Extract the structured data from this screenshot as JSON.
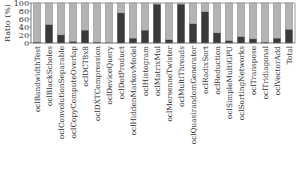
{
  "chart_data": {
    "type": "bar",
    "stacked": true,
    "title": "",
    "xlabel": "",
    "ylabel": "Ratio (%)",
    "ylim": [
      0,
      100
    ],
    "yticks": [
      0,
      20,
      40,
      60,
      80,
      100
    ],
    "grid": false,
    "legend": "none",
    "categories": [
      "oclBandwidthTest",
      "oclBlackScholes",
      "oclConvolutionSeparable",
      "oclCopyComputeOverlap",
      "oclDCT8x8",
      "oclDXTCompression",
      "oclDeviceQuery",
      "oclDotProduct",
      "oclHiddenMarkovModel",
      "oclHistogram",
      "oclMatrixMul",
      "oclMersenneTwister",
      "oclMultiThreads",
      "oclQuasirandomGenerator",
      "oclRadixSort",
      "oclReduction",
      "oclSimpleMultiGPU",
      "oclSortingNetworks",
      "oclTranspose",
      "oclTridiagonal",
      "oclVectorAdd",
      "Total"
    ],
    "series": [
      {
        "name": "dark",
        "color": "#3a3a3a",
        "values": [
          2,
          46,
          20,
          4,
          32,
          2,
          0,
          75,
          12,
          32,
          97,
          8,
          97,
          48,
          78,
          25,
          6,
          16,
          10,
          2,
          12,
          34
        ]
      },
      {
        "name": "light",
        "color": "#b4b4b4",
        "values": [
          98,
          54,
          80,
          96,
          68,
          98,
          100,
          25,
          88,
          68,
          3,
          92,
          3,
          52,
          22,
          75,
          94,
          84,
          90,
          98,
          88,
          66
        ]
      }
    ]
  }
}
